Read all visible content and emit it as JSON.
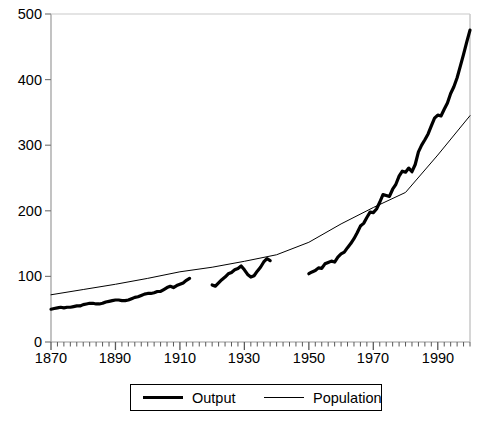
{
  "chart_data": {
    "type": "line",
    "title": "",
    "subtitle": "",
    "xlabel": "",
    "ylabel": "",
    "xlim": [
      1870,
      2000
    ],
    "ylim": [
      0,
      500
    ],
    "grid": false,
    "legend_position": "bottom",
    "x_tick_labels": [
      "1870",
      "1890",
      "1910",
      "1930",
      "1950",
      "1970",
      "1990"
    ],
    "x_tick_values": [
      1870,
      1890,
      1910,
      1930,
      1950,
      1970,
      1990
    ],
    "x_minor_tick_interval": 2,
    "y_tick_labels": [
      "0",
      "100",
      "200",
      "300",
      "400",
      "500"
    ],
    "y_tick_values": [
      0,
      100,
      200,
      300,
      400,
      500
    ],
    "series": [
      {
        "name": "Output",
        "style": "thick",
        "color": "#000000",
        "line_width": 3.2,
        "segments": [
          {
            "note": "1870-1913",
            "points": [
              [
                1870,
                50
              ],
              [
                1871,
                51
              ],
              [
                1872,
                52
              ],
              [
                1873,
                53
              ],
              [
                1874,
                52
              ],
              [
                1875,
                53
              ],
              [
                1876,
                53
              ],
              [
                1877,
                54
              ],
              [
                1878,
                55
              ],
              [
                1879,
                55
              ],
              [
                1880,
                57
              ],
              [
                1881,
                58
              ],
              [
                1882,
                59
              ],
              [
                1883,
                59
              ],
              [
                1884,
                58
              ],
              [
                1885,
                58
              ],
              [
                1886,
                59
              ],
              [
                1887,
                61
              ],
              [
                1888,
                62
              ],
              [
                1889,
                63
              ],
              [
                1890,
                64
              ],
              [
                1891,
                64
              ],
              [
                1892,
                63
              ],
              [
                1893,
                63
              ],
              [
                1894,
                64
              ],
              [
                1895,
                66
              ],
              [
                1896,
                68
              ],
              [
                1897,
                69
              ],
              [
                1898,
                71
              ],
              [
                1899,
                73
              ],
              [
                1900,
                74
              ],
              [
                1901,
                74
              ],
              [
                1902,
                75
              ],
              [
                1903,
                77
              ],
              [
                1904,
                77
              ],
              [
                1905,
                80
              ],
              [
                1906,
                83
              ],
              [
                1907,
                85
              ],
              [
                1908,
                83
              ],
              [
                1909,
                86
              ],
              [
                1910,
                88
              ],
              [
                1911,
                90
              ],
              [
                1912,
                94
              ],
              [
                1913,
                97
              ]
            ]
          },
          {
            "note": "1920-1938",
            "points": [
              [
                1920,
                87
              ],
              [
                1921,
                85
              ],
              [
                1922,
                90
              ],
              [
                1923,
                95
              ],
              [
                1924,
                99
              ],
              [
                1925,
                104
              ],
              [
                1926,
                106
              ],
              [
                1927,
                110
              ],
              [
                1928,
                112
              ],
              [
                1929,
                116
              ],
              [
                1930,
                110
              ],
              [
                1931,
                103
              ],
              [
                1932,
                99
              ],
              [
                1933,
                101
              ],
              [
                1934,
                108
              ],
              [
                1935,
                114
              ],
              [
                1936,
                122
              ],
              [
                1937,
                127
              ],
              [
                1938,
                124
              ]
            ]
          },
          {
            "note": "1950-2000",
            "points": [
              [
                1950,
                152
              ],
              [
                1951,
                156
              ],
              [
                1952,
                159
              ],
              [
                1953,
                165
              ],
              [
                1954,
                164
              ],
              [
                1955,
                174
              ],
              [
                1956,
                177
              ],
              [
                1957,
                180
              ],
              [
                1958,
                178
              ],
              [
                1959,
                189
              ],
              [
                1960,
                196
              ],
              [
                1961,
                200
              ],
              [
                1962,
                210
              ],
              [
                1963,
                219
              ],
              [
                1964,
                230
              ],
              [
                1965,
                243
              ],
              [
                1966,
                258
              ],
              [
                1967,
                264
              ],
              [
                1968,
                277
              ],
              [
                1969,
                289
              ],
              [
                1970,
                288
              ],
              [
                1971,
                296
              ],
              [
                1972,
                311
              ],
              [
                1973,
                328
              ],
              [
                1974,
                326
              ],
              [
                1975,
                324
              ],
              [
                1976,
                340
              ],
              [
                1977,
                351
              ],
              [
                1978,
                369
              ],
              [
                1979,
                380
              ],
              [
                1980,
                378
              ],
              [
                1981,
                387
              ],
              [
                1982,
                379
              ],
              [
                1983,
                395
              ],
              [
                1984,
                423
              ],
              [
                1985,
                438
              ],
              [
                1986,
                450
              ],
              [
                1987,
                463
              ],
              [
                1988,
                481
              ],
              [
                1989,
                498
              ],
              [
                1990,
                505
              ],
              [
                1991,
                503
              ],
              [
                1992,
                518
              ],
              [
                1993,
                532
              ],
              [
                1994,
                553
              ],
              [
                1995,
                568
              ],
              [
                1996,
                588
              ],
              [
                1997,
                614
              ],
              [
                1998,
                640
              ],
              [
                1999,
                668
              ],
              [
                2000,
                694
              ]
            ],
            "scale_note": "rendered-values"
          }
        ]
      },
      {
        "name": "Population",
        "style": "thin",
        "color": "#000000",
        "line_width": 1,
        "points": [
          [
            1870,
            72
          ],
          [
            1880,
            80
          ],
          [
            1890,
            88
          ],
          [
            1900,
            97
          ],
          [
            1910,
            107
          ],
          [
            1920,
            114
          ],
          [
            1930,
            123
          ],
          [
            1940,
            133
          ],
          [
            1950,
            152
          ],
          [
            1960,
            180
          ],
          [
            1970,
            205
          ],
          [
            1980,
            228
          ],
          [
            1990,
            285
          ],
          [
            2000,
            345
          ]
        ]
      }
    ]
  },
  "axes": {
    "y_labels": [
      "500",
      "400",
      "300",
      "200",
      "100",
      "0"
    ],
    "x_labels": [
      "1870",
      "1890",
      "1910",
      "1930",
      "1950",
      "1970",
      "1990"
    ]
  },
  "legend": {
    "items": [
      {
        "label": "Output",
        "style": "thick"
      },
      {
        "label": "Population",
        "style": "thin"
      }
    ]
  }
}
